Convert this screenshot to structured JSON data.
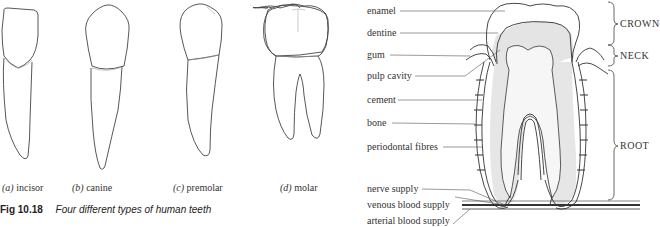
{
  "left_figure": {
    "teeth": [
      {
        "letter": "(a)",
        "name": "incisor"
      },
      {
        "letter": "(b)",
        "name": "canine"
      },
      {
        "letter": "(c)",
        "name": "premolar"
      },
      {
        "letter": "(d)",
        "name": "molar"
      }
    ],
    "caption": {
      "number": "Fig 10.18",
      "text": "Four different types of human teeth"
    }
  },
  "right_figure": {
    "labels": [
      {
        "text": "enamel"
      },
      {
        "text": "dentine"
      },
      {
        "text": "gum"
      },
      {
        "text": "pulp cavity"
      },
      {
        "text": "cement"
      },
      {
        "text": "bone"
      },
      {
        "text": "periodontal fibres"
      },
      {
        "text": "nerve supply"
      },
      {
        "text": "venous blood supply"
      },
      {
        "text": "arterial blood supply"
      }
    ],
    "regions": [
      {
        "text": "CROWN"
      },
      {
        "text": "NECK"
      },
      {
        "text": "ROOT"
      }
    ]
  }
}
